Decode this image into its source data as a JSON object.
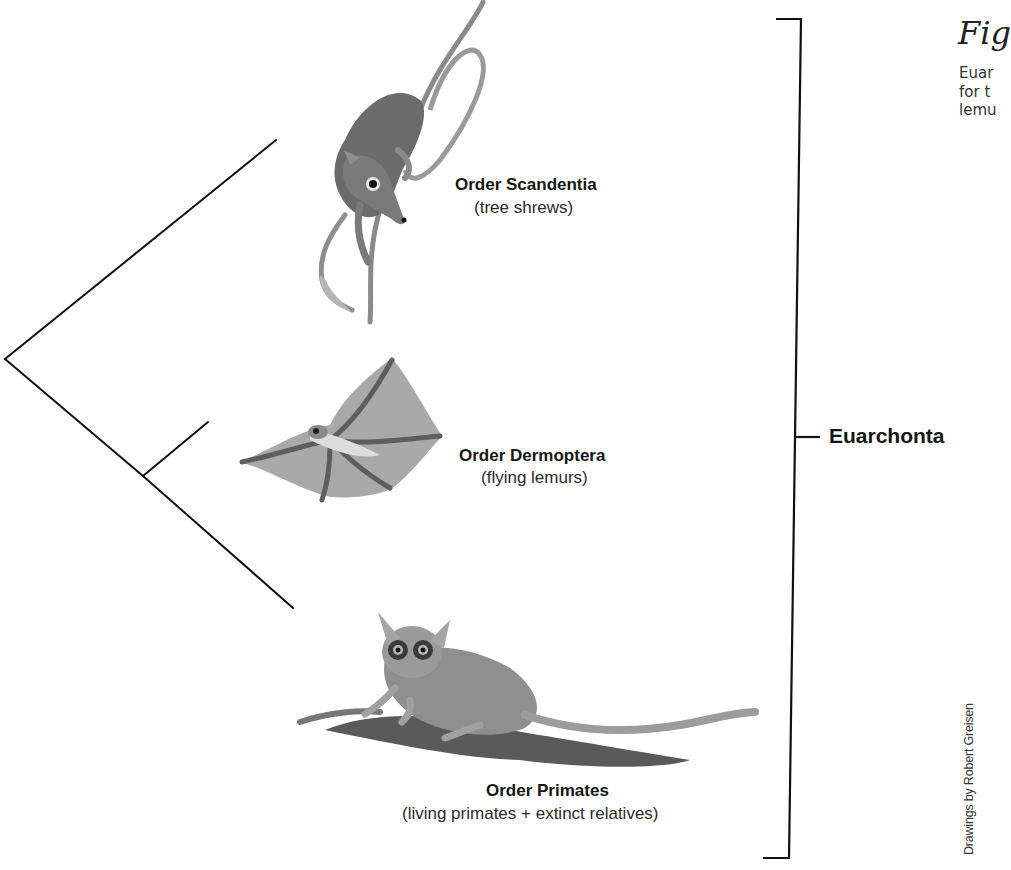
{
  "figure": {
    "caption": {
      "fig_label": "Fig",
      "lines": [
        "Euar",
        "for t",
        "lemu"
      ]
    },
    "credit": "Drawings by Robert Greisen"
  },
  "tree": {
    "clade": {
      "name": "Euarchonta"
    },
    "taxa": [
      {
        "order": "Order Scandentia",
        "common": "(tree shrews)",
        "illustration": "tree-shrew"
      },
      {
        "order": "Order Dermoptera",
        "common": "(flying lemurs)",
        "illustration": "flying-lemur"
      },
      {
        "order": "Order Primates",
        "common": "(living primates + extinct relatives)",
        "illustration": "bushbaby"
      }
    ],
    "topology": "(Scandentia,(Dermoptera,Primates))",
    "line_color": "#111111"
  }
}
